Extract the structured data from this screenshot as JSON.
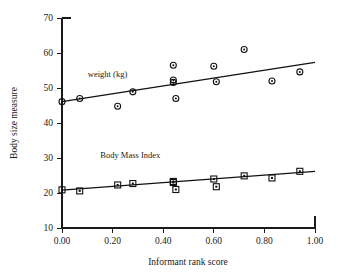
{
  "chart_data": {
    "type": "scatter",
    "title": "",
    "xlabel": "Informant rank score",
    "ylabel": "Body size measure",
    "xlim": [
      0.0,
      1.0
    ],
    "ylim": [
      10,
      70
    ],
    "grid": false,
    "legend_position": "inline-annotation",
    "xticks": [
      0.0,
      0.2,
      0.4,
      0.6,
      0.8,
      1.0
    ],
    "xticklabels": [
      "0.00",
      "0.20",
      "0.40",
      "0.60",
      "0.80",
      "1.00"
    ],
    "yticks": [
      10,
      20,
      30,
      40,
      50,
      60,
      70
    ],
    "yticklabels": [
      "10",
      "20",
      "30",
      "40",
      "50",
      "60",
      "70"
    ],
    "annotations": [
      {
        "text": "weight  (kg)",
        "x": 0.18,
        "y": 53.2
      },
      {
        "text": "Body Mass Index",
        "x": 0.27,
        "y": 30.0
      }
    ],
    "series": [
      {
        "name": "weight  (kg)",
        "marker": "circle",
        "points": [
          {
            "x": 0.0,
            "y": 46.1
          },
          {
            "x": 0.07,
            "y": 47.0
          },
          {
            "x": 0.22,
            "y": 44.8
          },
          {
            "x": 0.28,
            "y": 48.9
          },
          {
            "x": 0.44,
            "y": 56.5
          },
          {
            "x": 0.44,
            "y": 52.3
          },
          {
            "x": 0.44,
            "y": 51.6
          },
          {
            "x": 0.45,
            "y": 47.0
          },
          {
            "x": 0.6,
            "y": 56.2
          },
          {
            "x": 0.61,
            "y": 51.8
          },
          {
            "x": 0.72,
            "y": 61.0
          },
          {
            "x": 0.83,
            "y": 52.0
          },
          {
            "x": 0.94,
            "y": 54.6
          }
        ],
        "fit_line": {
          "x0": 0.0,
          "y0": 46.1,
          "x1": 1.0,
          "y1": 57.3
        }
      },
      {
        "name": "Body Mass Index",
        "marker": "square",
        "points": [
          {
            "x": 0.0,
            "y": 20.9
          },
          {
            "x": 0.07,
            "y": 20.6
          },
          {
            "x": 0.22,
            "y": 22.3
          },
          {
            "x": 0.28,
            "y": 22.7
          },
          {
            "x": 0.44,
            "y": 23.3
          },
          {
            "x": 0.44,
            "y": 23.0
          },
          {
            "x": 0.45,
            "y": 21.0
          },
          {
            "x": 0.6,
            "y": 24.0
          },
          {
            "x": 0.61,
            "y": 21.8
          },
          {
            "x": 0.72,
            "y": 24.9
          },
          {
            "x": 0.83,
            "y": 24.3
          },
          {
            "x": 0.94,
            "y": 26.2
          }
        ],
        "fit_line": {
          "x0": 0.0,
          "y0": 20.8,
          "x1": 1.0,
          "y1": 26.2
        }
      }
    ]
  },
  "colors": {
    "ink": "#1a1a1a",
    "marker": "#111111",
    "background": "#ffffff"
  }
}
